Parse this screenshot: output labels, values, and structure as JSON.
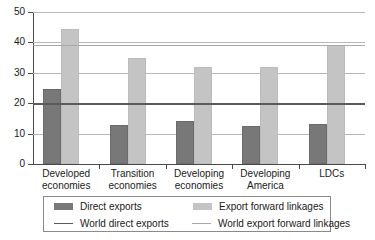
{
  "chart_data": {
    "type": "bar",
    "title": "",
    "subtitle": "",
    "xlabel": "",
    "ylabel": "",
    "ylim": [
      0,
      50
    ],
    "yticks": [
      0,
      10,
      20,
      30,
      40,
      50
    ],
    "grid": true,
    "legend_position": "bottom",
    "categories": [
      "Developed economies",
      "Transition economies",
      "Developing economies",
      "Developing America",
      "LDCs"
    ],
    "category_lines": [
      [
        "Developed",
        "economies"
      ],
      [
        "Transition",
        "economies"
      ],
      [
        "Developing",
        "economies"
      ],
      [
        "Developing",
        "America"
      ],
      [
        "LDCs",
        ""
      ]
    ],
    "series": [
      {
        "name": "Direct exports",
        "type": "bar",
        "color": "#787878",
        "values": [
          24.8,
          12.8,
          14.0,
          12.5,
          13.2
        ]
      },
      {
        "name": "Export forward linkages",
        "type": "bar",
        "color": "#c4c4c4",
        "values": [
          44.5,
          35.0,
          32.0,
          32.0,
          39.3
        ]
      }
    ],
    "reference_lines": [
      {
        "name": "World direct exports",
        "type": "line",
        "color": "#5a5a5a",
        "value": 20.0
      },
      {
        "name": "World export forward linkages",
        "type": "line",
        "color": "#a9a9a9",
        "value": 39.0
      }
    ]
  },
  "legend": {
    "items": [
      {
        "label": "Direct exports",
        "marker": "bar-swatch-dark"
      },
      {
        "label": "Export forward linkages",
        "marker": "bar-swatch-light"
      },
      {
        "label": "World direct exports",
        "marker": "line-swatch-dark"
      },
      {
        "label": "World export forward linkages",
        "marker": "line-swatch-light"
      }
    ]
  }
}
